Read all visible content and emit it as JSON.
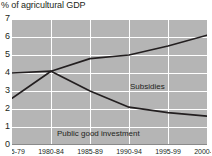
{
  "chart_data": {
    "type": "line",
    "title": "% of agricultural GDP",
    "xlabel": "",
    "ylabel": "",
    "ylim": [
      0,
      7
    ],
    "yticks": [
      0,
      1,
      2,
      3,
      4,
      5,
      6,
      7
    ],
    "categories": [
      "1975-79",
      "1980-84",
      "1985-89",
      "1990-94",
      "1995-99",
      "2000-04"
    ],
    "grid": true,
    "legend_position": "inline-annotation",
    "series": [
      {
        "name": "Subsidies",
        "color": "#231f20",
        "values": [
          2.6,
          4.1,
          4.8,
          5.0,
          5.5,
          6.1
        ]
      },
      {
        "name": "Public good investment",
        "color": "#231f20",
        "values": [
          4.0,
          4.1,
          3.0,
          2.1,
          1.8,
          1.6
        ]
      }
    ],
    "annotations": [
      {
        "text": "Subsidies",
        "series": "Subsidies"
      },
      {
        "text": "Public good investment",
        "series": "Public good investment"
      }
    ]
  },
  "axis": {
    "y_labels": [
      "7",
      "6",
      "5",
      "4",
      "3",
      "2",
      "1",
      "0"
    ],
    "x_labels": [
      "1975-79",
      "1980-84",
      "1985-89",
      "1990-94",
      "1995-99",
      "2000-04"
    ]
  },
  "colors": {
    "plot_background": "#b5b5b5",
    "gridline": "#ffffff",
    "line": "#231f20",
    "text": "#231f20",
    "page_background": "#ffffff"
  }
}
